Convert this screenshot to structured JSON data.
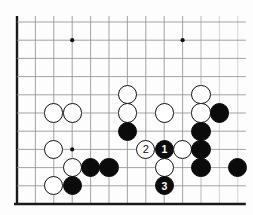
{
  "diagram": {
    "type": "go-board-diagram",
    "board": {
      "cols": 13,
      "rows": 11,
      "origin_x": 17,
      "origin_y": 22,
      "step_x": 18.4,
      "step_y": 18.2,
      "line_color": "#999999",
      "edge_color": "#1a1a1a",
      "background": "#fdfdfd",
      "left_edge_emphasis": true,
      "bottom_edge_emphasis": true
    },
    "star_points": [
      {
        "col": 3,
        "row": 1
      },
      {
        "col": 9,
        "row": 1
      },
      {
        "col": 3,
        "row": 7
      }
    ],
    "stones": [
      {
        "col": 6,
        "row": 4,
        "color": "white",
        "label": ""
      },
      {
        "col": 2,
        "row": 5,
        "color": "white",
        "label": ""
      },
      {
        "col": 3,
        "row": 5,
        "color": "white",
        "label": ""
      },
      {
        "col": 6,
        "row": 5,
        "color": "white",
        "label": ""
      },
      {
        "col": 8,
        "row": 5,
        "color": "white",
        "label": ""
      },
      {
        "col": 10,
        "row": 4,
        "color": "white",
        "label": ""
      },
      {
        "col": 10,
        "row": 5,
        "color": "white",
        "label": ""
      },
      {
        "col": 11,
        "row": 5,
        "color": "black",
        "label": ""
      },
      {
        "col": 6,
        "row": 6,
        "color": "black",
        "label": ""
      },
      {
        "col": 10,
        "row": 6,
        "color": "black",
        "label": ""
      },
      {
        "col": 2,
        "row": 7,
        "color": "white",
        "label": ""
      },
      {
        "col": 7,
        "row": 7,
        "color": "white",
        "label": "2"
      },
      {
        "col": 8,
        "row": 7,
        "color": "black",
        "label": "1"
      },
      {
        "col": 9,
        "row": 7,
        "color": "white",
        "label": ""
      },
      {
        "col": 10,
        "row": 7,
        "color": "black",
        "label": ""
      },
      {
        "col": 3,
        "row": 8,
        "color": "white",
        "label": ""
      },
      {
        "col": 4,
        "row": 8,
        "color": "black",
        "label": ""
      },
      {
        "col": 5,
        "row": 8,
        "color": "black",
        "label": ""
      },
      {
        "col": 8,
        "row": 8,
        "color": "white",
        "label": ""
      },
      {
        "col": 10,
        "row": 8,
        "color": "black",
        "label": ""
      },
      {
        "col": 12,
        "row": 8,
        "color": "black",
        "label": ""
      },
      {
        "col": 2,
        "row": 9,
        "color": "white",
        "label": ""
      },
      {
        "col": 3,
        "row": 9,
        "color": "black",
        "label": ""
      },
      {
        "col": 8,
        "row": 9,
        "color": "black",
        "label": "3"
      }
    ],
    "move_labels": [
      {
        "number": "1",
        "color": "black"
      },
      {
        "number": "2",
        "color": "white"
      },
      {
        "number": "3",
        "color": "black"
      }
    ],
    "stone_radius": 9.6,
    "star_radius": 2.1
  }
}
